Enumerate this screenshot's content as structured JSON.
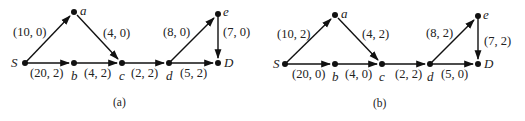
{
  "figures": [
    {
      "id": "a",
      "caption": "(a)",
      "offset_x": 0,
      "offset_y": 0,
      "nodes": [
        {
          "id": "S",
          "label": "S",
          "x": 25,
          "y": 63
        },
        {
          "id": "a",
          "label": "a",
          "x": 74,
          "y": 12
        },
        {
          "id": "b",
          "label": "b",
          "x": 74,
          "y": 63
        },
        {
          "id": "c",
          "label": "c",
          "x": 122,
          "y": 63
        },
        {
          "id": "d",
          "label": "d",
          "x": 169,
          "y": 63
        },
        {
          "id": "e",
          "label": "e",
          "x": 218,
          "y": 14
        },
        {
          "id": "D",
          "label": "D",
          "x": 218,
          "y": 63
        }
      ],
      "edges": [
        {
          "from": "S",
          "to": "a",
          "label": "(10, 0)"
        },
        {
          "from": "S",
          "to": "b",
          "label": "(20, 2)"
        },
        {
          "from": "a",
          "to": "c",
          "label": "(4, 0)"
        },
        {
          "from": "b",
          "to": "c",
          "label": "(4, 2)"
        },
        {
          "from": "c",
          "to": "d",
          "label": "(2, 2)"
        },
        {
          "from": "d",
          "to": "e",
          "label": "(8, 0)"
        },
        {
          "from": "d",
          "to": "D",
          "label": "(5, 2)"
        },
        {
          "from": "e",
          "to": "D",
          "label": "(7, 0)"
        }
      ]
    },
    {
      "id": "b",
      "caption": "(b)",
      "offset_x": 0,
      "offset_y": 0,
      "nodes": [
        {
          "id": "S",
          "label": "S",
          "x": 285,
          "y": 64
        },
        {
          "id": "a",
          "label": "a",
          "x": 335,
          "y": 15
        },
        {
          "id": "b",
          "label": "b",
          "x": 335,
          "y": 64
        },
        {
          "id": "c",
          "label": "c",
          "x": 382,
          "y": 64
        },
        {
          "id": "d",
          "label": "d",
          "x": 430,
          "y": 64
        },
        {
          "id": "e",
          "label": "e",
          "x": 478,
          "y": 16
        },
        {
          "id": "D",
          "label": "D",
          "x": 478,
          "y": 64
        }
      ],
      "edges": [
        {
          "from": "S",
          "to": "a",
          "label": "(10, 2)"
        },
        {
          "from": "S",
          "to": "b",
          "label": "(20, 0)"
        },
        {
          "from": "a",
          "to": "c",
          "label": "(4, 2)"
        },
        {
          "from": "b",
          "to": "c",
          "label": "(4, 0)"
        },
        {
          "from": "c",
          "to": "d",
          "label": "(2, 2)"
        },
        {
          "from": "d",
          "to": "e",
          "label": "(8, 2)"
        },
        {
          "from": "d",
          "to": "D",
          "label": "(5, 0)"
        },
        {
          "from": "e",
          "to": "D",
          "label": "(7, 2)"
        }
      ]
    }
  ]
}
